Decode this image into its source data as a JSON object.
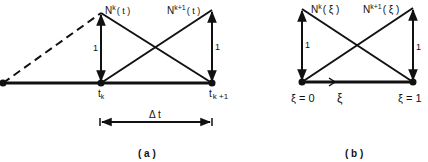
{
  "panel_a": {
    "caption": "( a )",
    "shape_left_label": "N",
    "shape_left_sup": "k",
    "shape_left_arg": "( t )",
    "shape_right_label": "N",
    "shape_right_sup": "k+1",
    "shape_right_arg": "( t )",
    "height_left": "1",
    "height_right": "1",
    "node_left_label": "t",
    "node_left_sub": "k",
    "node_right_label": "t",
    "node_right_sub": "k +1",
    "interval_label": "Δ t"
  },
  "panel_b": {
    "caption": "( b )",
    "shape_left_label": "N",
    "shape_left_sup": "k",
    "shape_left_arg": "( ξ )",
    "shape_right_label": "N",
    "shape_right_sup": "k+1",
    "shape_right_arg": "( ξ )",
    "height_left": "1",
    "height_right": "1",
    "node_left_label": "ξ = 0",
    "node_right_label": "ξ = 1",
    "axis_label": "ξ"
  },
  "colors": {
    "ink": "#111111",
    "background": "#ffffff"
  }
}
